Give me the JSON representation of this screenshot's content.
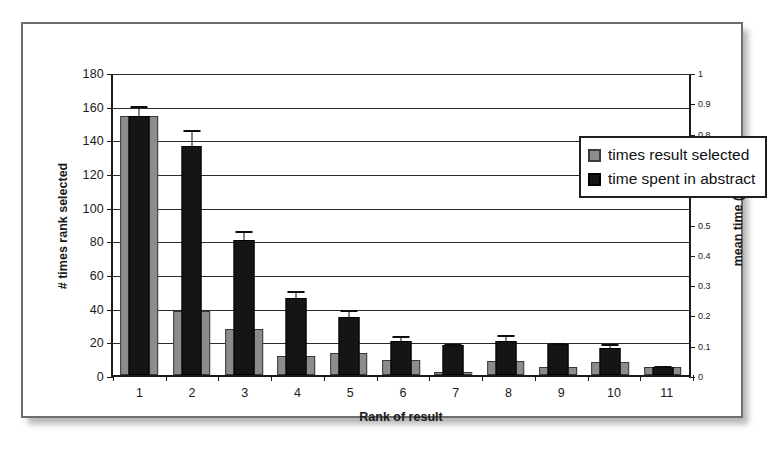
{
  "figure": {
    "frame_border_color": "#6e6e6e",
    "background": "#ffffff"
  },
  "legend": {
    "position": "top-right-inside",
    "entries": [
      {
        "label": "times result selected",
        "color": "#8c8c8c",
        "swatch": "gray"
      },
      {
        "label": "time spent in abstract",
        "color": "#151515",
        "swatch": "black"
      }
    ]
  },
  "chart_data": {
    "type": "bar",
    "title": "",
    "xlabel": "Rank of result",
    "ylabel": "# times rank selected",
    "y2label": "mean time (s)",
    "categories": [
      "1",
      "2",
      "3",
      "4",
      "5",
      "6",
      "7",
      "8",
      "9",
      "10",
      "11"
    ],
    "ylim": [
      0,
      180
    ],
    "yticks": [
      0,
      20,
      40,
      60,
      80,
      100,
      120,
      140,
      160,
      180
    ],
    "y2lim": [
      0,
      1
    ],
    "y2ticks": [
      0,
      0.1,
      0.2,
      0.3,
      0.4,
      0.5,
      0.6,
      0.7,
      0.8,
      0.9,
      1
    ],
    "grid": true,
    "series": [
      {
        "name": "times result selected",
        "axis": "left",
        "color": "#8c8c8c",
        "values": [
          154,
          38,
          27.5,
          11.5,
          13,
          9,
          1.5,
          8.5,
          4.5,
          7.5,
          4.5
        ],
        "errors": [
          0,
          0,
          0,
          0,
          0,
          0,
          0,
          0,
          0,
          0,
          0
        ]
      },
      {
        "name": "time spent in abstract",
        "axis": "right",
        "color": "#151515",
        "values": [
          154,
          136,
          80,
          45.5,
          34.5,
          20.5,
          18,
          20.5,
          18.5,
          16,
          5
        ],
        "errors": [
          7,
          10.5,
          6.5,
          5.5,
          5.5,
          4,
          1.5,
          4.5,
          1.5,
          3.5,
          1.5
        ]
      }
    ]
  }
}
